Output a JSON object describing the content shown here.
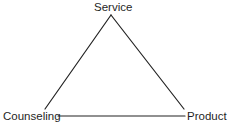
{
  "diagram": {
    "type": "triangle",
    "nodes": {
      "top": {
        "label": "Service"
      },
      "left": {
        "label": "Counseling"
      },
      "right": {
        "label": "Product"
      }
    },
    "edges": [
      {
        "from": "top",
        "to": "left"
      },
      {
        "from": "top",
        "to": "right"
      },
      {
        "from": "left",
        "to": "right"
      }
    ],
    "line_color": "#222222"
  }
}
